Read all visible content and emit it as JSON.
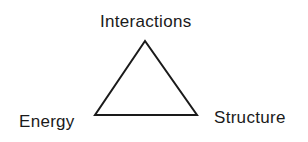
{
  "diagram": {
    "type": "triangle",
    "vertices": {
      "top": {
        "label": "Interactions"
      },
      "bottom_left": {
        "label": "Energy"
      },
      "bottom_right": {
        "label": "Structure"
      }
    },
    "stroke_color": "#1a1a1a",
    "text_color": "#1a1a1a",
    "background": "#ffffff"
  }
}
